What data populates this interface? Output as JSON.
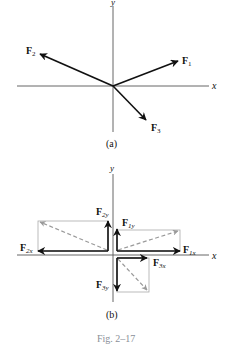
{
  "figure": {
    "caption": "Fig. 2–17",
    "colors": {
      "axis": "#555555",
      "vector": "#111111",
      "resultant_dashed": "#9a9a9a",
      "rect": "#aaaaaa",
      "caption": "#8a8f98"
    },
    "panel_a": {
      "label": "(a)",
      "axes": {
        "x_label": "x",
        "y_label": "y"
      },
      "vectors": [
        {
          "name": "F",
          "sub": "1",
          "direction": "up-right"
        },
        {
          "name": "F",
          "sub": "2",
          "direction": "up-left"
        },
        {
          "name": "F",
          "sub": "3",
          "direction": "down-right"
        }
      ]
    },
    "panel_b": {
      "label": "(b)",
      "axes": {
        "x_label": "x",
        "y_label": "y"
      },
      "components": [
        {
          "name": "F",
          "sub": "1x",
          "direction": "+x"
        },
        {
          "name": "F",
          "sub": "1y",
          "direction": "+y"
        },
        {
          "name": "F",
          "sub": "2x",
          "direction": "-x"
        },
        {
          "name": "F",
          "sub": "2y",
          "direction": "+y"
        },
        {
          "name": "F",
          "sub": "3x",
          "direction": "+x"
        },
        {
          "name": "F",
          "sub": "3y",
          "direction": "-y"
        }
      ]
    }
  }
}
